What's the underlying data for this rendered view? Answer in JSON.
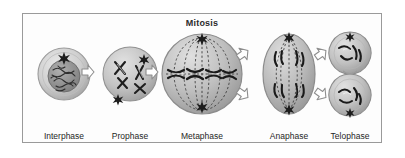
{
  "figure": {
    "title": "Mitosis",
    "border_color": "#9a9a9a",
    "background_color": "#fdfdfd",
    "text_color": "#1f1f1f"
  },
  "stages": [
    {
      "id": "interphase",
      "label": "Interphase",
      "description": "Round cell with intact nucleus containing tangled chromatin and a single star-shaped centrosome above the nucleus",
      "cell_shape": "circle",
      "centrosome_count": 1,
      "nucleus_visible": true,
      "spindle_visible": false
    },
    {
      "id": "prophase",
      "label": "Prophase",
      "description": "Round cell with condensed X-shaped chromosomes and two star-shaped centrosomes at opposite sides",
      "cell_shape": "circle",
      "centrosome_count": 2,
      "nucleus_visible": false,
      "spindle_visible": false
    },
    {
      "id": "metaphase",
      "label": "Metaphase",
      "description": "Large round cell with dashed spindle fibers spanning pole to pole and chromosomes aligned along the equator",
      "cell_shape": "circle",
      "centrosome_count": 2,
      "nucleus_visible": false,
      "spindle_visible": true
    },
    {
      "id": "anaphase",
      "label": "Anaphase",
      "description": "Elongated oval cell with sister chromatids separated and drawn toward opposite poles by dashed spindle fibers",
      "cell_shape": "oval",
      "centrosome_count": 2,
      "nucleus_visible": false,
      "spindle_visible": true
    },
    {
      "id": "telophase",
      "label": "Telophase",
      "description": "Two daughter cells stacked vertically joined by a cleavage furrow, each containing a set of chromosomes",
      "cell_shape": "two-cells",
      "centrosome_count": 2,
      "nucleus_visible": true,
      "spindle_visible": false
    }
  ],
  "arrows": [
    {
      "id": "interphase-prophase",
      "from": "Interphase",
      "to": "Prophase",
      "style": "single",
      "direction": "right"
    },
    {
      "id": "prophase-metaphase",
      "from": "Prophase",
      "to": "Metaphase",
      "style": "single",
      "direction": "right"
    },
    {
      "id": "metaphase-anaphase",
      "from": "Metaphase",
      "to": "Anaphase",
      "style": "branching",
      "direction": "up-and-down-right"
    },
    {
      "id": "anaphase-telophase",
      "from": "Anaphase",
      "to": "Telophase",
      "style": "branching",
      "direction": "up-and-down-right"
    }
  ]
}
